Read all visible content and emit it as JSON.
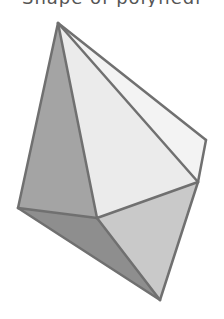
{
  "caption": {
    "text": "Shape of polyhedron, cropped"
  },
  "figure": {
    "type": "polyhedron-illustration",
    "stroke_color": "#707070",
    "vertices": {
      "apex": [
        58,
        23
      ],
      "right": [
        206,
        140
      ],
      "right_mid": [
        198,
        182
      ],
      "center": [
        97,
        218
      ],
      "left": [
        18,
        208
      ],
      "bottom": [
        160,
        300
      ]
    },
    "faces": [
      {
        "name": "left-face",
        "points": "apex,left,center",
        "fill": "#a4a4a4"
      },
      {
        "name": "front-face",
        "points": "apex,center,right_mid",
        "fill": "#ebebeb"
      },
      {
        "name": "right-face",
        "points": "apex,right,right_mid",
        "fill": "#f3f3f3"
      },
      {
        "name": "bottom-left-face",
        "points": "left,center,bottom",
        "fill": "#8e8e8e"
      },
      {
        "name": "bottom-right-face",
        "points": "center,right_mid,bottom",
        "fill": "#c9c9c9"
      }
    ]
  }
}
